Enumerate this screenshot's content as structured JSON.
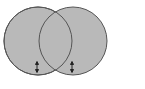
{
  "diagram": {
    "type": "venn",
    "circles": [
      {
        "id": "left",
        "cx": 38,
        "cy": 41,
        "r": 34,
        "fill": "#b8b8b8",
        "stroke": "#555555"
      },
      {
        "id": "right",
        "cx": 73,
        "cy": 41,
        "r": 34,
        "fill": "#b8b8b8",
        "stroke": "#555555"
      }
    ],
    "markers": [
      {
        "id": "left-arrow",
        "x": 37,
        "y1": 62,
        "y2": 72,
        "icon": "double-arrow-vertical-icon"
      },
      {
        "id": "right-arrow",
        "x": 72,
        "y1": 62,
        "y2": 72,
        "icon": "double-arrow-vertical-icon"
      }
    ]
  }
}
